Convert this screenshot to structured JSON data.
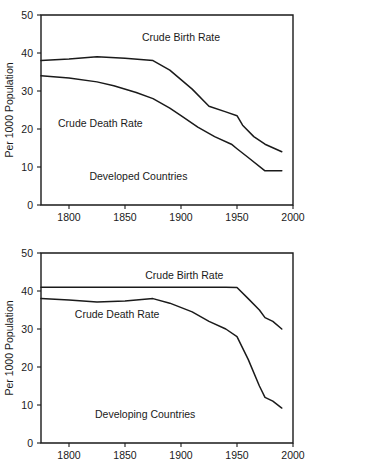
{
  "figure": {
    "background": "#ffffff",
    "line_color": "#1a1a1a",
    "panel_count": 2
  },
  "chart_data": [
    {
      "type": "line",
      "title": "Developed Countries",
      "xlabel": "",
      "ylabel": "Per 1000 Population",
      "xlim": [
        1775,
        2000
      ],
      "ylim": [
        0,
        50
      ],
      "grid": false,
      "legend_position": "inline-annotation",
      "xticks": [
        1800,
        1850,
        1900,
        1950,
        2000
      ],
      "yticks": [
        0,
        10,
        20,
        30,
        40,
        50
      ],
      "annotations": [
        {
          "text": "Crude Birth Rate",
          "x": 1900,
          "y": 44
        },
        {
          "text": "Crude Death Rate",
          "x": 1828,
          "y": 21.5
        },
        {
          "text": "Developed Countries",
          "x": 1862,
          "y": 7.5
        }
      ],
      "series": [
        {
          "name": "Crude Birth Rate",
          "x": [
            1775,
            1800,
            1825,
            1850,
            1875,
            1890,
            1900,
            1910,
            1925,
            1940,
            1950,
            1955,
            1965,
            1975,
            1990
          ],
          "values": [
            38,
            38.4,
            39,
            38.6,
            38,
            35.5,
            33,
            30.5,
            26,
            24.5,
            23.5,
            21,
            18,
            16,
            14
          ]
        },
        {
          "name": "Crude Death Rate",
          "x": [
            1775,
            1800,
            1825,
            1840,
            1860,
            1875,
            1890,
            1900,
            1915,
            1930,
            1945,
            1950,
            1960,
            1975,
            1990
          ],
          "values": [
            34,
            33.4,
            32.4,
            31.4,
            29.6,
            28,
            25.5,
            23.5,
            20.5,
            18,
            16,
            14.8,
            12.5,
            9,
            9
          ]
        }
      ]
    },
    {
      "type": "line",
      "title": "Developing Countries",
      "xlabel": "",
      "ylabel": "Per 1000 Population",
      "xlim": [
        1775,
        2000
      ],
      "ylim": [
        0,
        50
      ],
      "grid": false,
      "legend_position": "inline-annotation",
      "xticks": [
        1800,
        1850,
        1900,
        1950,
        2000
      ],
      "yticks": [
        0,
        10,
        20,
        30,
        40,
        50
      ],
      "annotations": [
        {
          "text": "Crude Birth Rate",
          "x": 1903,
          "y": 44.2
        },
        {
          "text": "Crude Death Rate",
          "x": 1843,
          "y": 33.8
        },
        {
          "text": "Developing Countries",
          "x": 1868,
          "y": 7.5
        }
      ],
      "series": [
        {
          "name": "Crude Birth Rate",
          "x": [
            1775,
            1850,
            1900,
            1940,
            1950,
            1960,
            1970,
            1975,
            1982,
            1990
          ],
          "values": [
            41,
            41,
            41,
            41,
            40.9,
            38,
            35,
            33,
            32,
            30
          ]
        },
        {
          "name": "Crude Death Rate",
          "x": [
            1775,
            1800,
            1825,
            1850,
            1875,
            1890,
            1910,
            1925,
            1940,
            1950,
            1960,
            1970,
            1975,
            1982,
            1990
          ],
          "values": [
            38,
            37.6,
            37.1,
            37.4,
            38,
            36.8,
            34.5,
            32,
            30,
            28,
            22,
            15,
            12,
            11,
            9.2
          ]
        }
      ]
    }
  ]
}
